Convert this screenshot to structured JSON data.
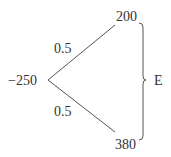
{
  "diagram": {
    "type": "decision-tree",
    "root": {
      "value": "−250"
    },
    "branches": [
      {
        "probability": "0.5",
        "outcome": "200"
      },
      {
        "probability": "0.5",
        "outcome": "380"
      }
    ],
    "bracket_label": "E",
    "line_color": "#555555"
  }
}
